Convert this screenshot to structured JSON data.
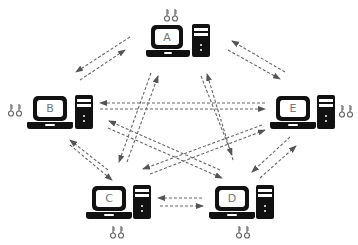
{
  "diagram": {
    "title": "",
    "background": "#ffffff",
    "arrow_color": "#555555",
    "nodes": [
      {
        "id": "A",
        "label": "A",
        "keys_position": "top"
      },
      {
        "id": "B",
        "label": "B",
        "keys_position": "left"
      },
      {
        "id": "C",
        "label": "C",
        "keys_position": "bottom"
      },
      {
        "id": "D",
        "label": "D",
        "keys_position": "bottom"
      },
      {
        "id": "E",
        "label": "E",
        "keys_position": "right"
      }
    ],
    "edges": [
      {
        "from": "A",
        "to": "B",
        "style": "dashed",
        "bidirectional": true
      },
      {
        "from": "A",
        "to": "E",
        "style": "dashed",
        "bidirectional": true
      },
      {
        "from": "A",
        "to": "C",
        "style": "dashed",
        "bidirectional": true
      },
      {
        "from": "A",
        "to": "D",
        "style": "dashed",
        "bidirectional": true
      },
      {
        "from": "B",
        "to": "E",
        "style": "dashed",
        "bidirectional": true
      },
      {
        "from": "B",
        "to": "C",
        "style": "dashed",
        "bidirectional": true
      },
      {
        "from": "B",
        "to": "D",
        "style": "dashed",
        "bidirectional": true
      },
      {
        "from": "E",
        "to": "C",
        "style": "dashed",
        "bidirectional": true
      },
      {
        "from": "E",
        "to": "D",
        "style": "dashed",
        "bidirectional": true
      },
      {
        "from": "C",
        "to": "D",
        "style": "dashed",
        "bidirectional": true
      }
    ]
  }
}
